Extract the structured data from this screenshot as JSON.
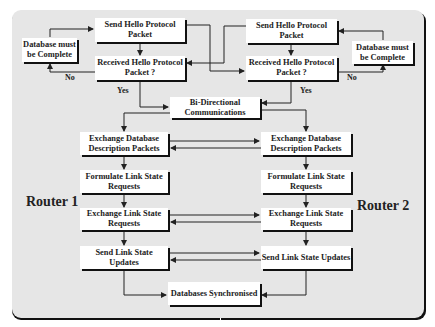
{
  "diagram": {
    "routers": {
      "left": {
        "label": "Router 1"
      },
      "right": {
        "label": "Router 2"
      }
    },
    "left": {
      "db_complete": "Database must be Complete",
      "send_hello": "Send Hello Protocol Packet",
      "received_hello": "Received Hello Protocol Packet ?",
      "no_label": "No",
      "yes_label": "Yes",
      "exchange_db_desc": "Exchange Database Description Packets",
      "formulate_lsr": "Formulate Link State Requests",
      "exchange_lsr": "Exchange Link State Requests",
      "send_lsu": "Send Link State Updates"
    },
    "right": {
      "db_complete": "Database must be Complete",
      "send_hello": "Send Hello Protocol Packet",
      "received_hello": "Received Hello Protocol Packet ?",
      "no_label": "No",
      "yes_label": "Yes",
      "exchange_db_desc": "Exchange Database Description Packets",
      "formulate_lsr": "Formulate Link State Requests",
      "exchange_lsr": "Exchange Link State Requests",
      "send_lsu": "Send Link State Updates"
    },
    "shared": {
      "bidirectional": "Bi-Directional Communications",
      "synchronised": "Databases Synchronised"
    },
    "colors": {
      "panel_bg": "#e6e6e6",
      "box_bg": "#ffffff",
      "line": "#222222",
      "shadow": "#111111"
    }
  }
}
